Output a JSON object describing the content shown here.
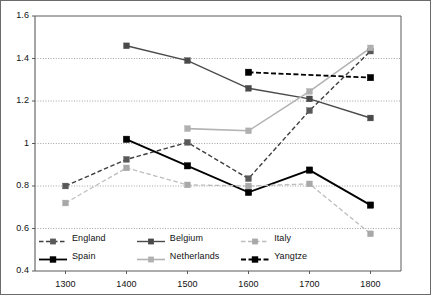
{
  "chart_data": {
    "type": "line",
    "title": "",
    "subtitle": "",
    "xlabel": "",
    "ylabel": "",
    "x": [
      1300,
      1400,
      1500,
      1600,
      1700,
      1800
    ],
    "categories": [
      "1300",
      "1400",
      "1500",
      "1600",
      "1700",
      "1800"
    ],
    "xlim": [
      1250,
      1850
    ],
    "ylim": [
      0.4,
      1.6
    ],
    "yticks": [
      0.4,
      0.6,
      0.8,
      1.0,
      1.2,
      1.4,
      1.6
    ],
    "ytick_labels": [
      "0.4",
      "0.6",
      "0.8",
      "1",
      "1.2",
      "1.4",
      "1.6"
    ],
    "xticks": [
      1300,
      1400,
      1500,
      1600,
      1700,
      1800
    ],
    "xtick_labels": [
      "1300",
      "1400",
      "1500",
      "1600",
      "1700",
      "1800"
    ],
    "grid": "horizontal-dotted",
    "legend_position": "inside-bottom-left",
    "marker": "square",
    "series": [
      {
        "name": "England",
        "color": "#3f3f3f",
        "style": "dashed",
        "width": 1.4,
        "marker_color": "#595959",
        "x": [
          1300,
          1400,
          1500,
          1600,
          1700,
          1800
        ],
        "values": [
          0.8,
          0.925,
          1.005,
          0.835,
          1.155,
          1.435
        ]
      },
      {
        "name": "Spain",
        "color": "#000000",
        "style": "solid",
        "width": 1.8,
        "marker_color": "#000000",
        "x": [
          1400,
          1500,
          1600,
          1700,
          1800
        ],
        "values": [
          1.02,
          0.895,
          0.77,
          0.875,
          0.71
        ]
      },
      {
        "name": "Belgium",
        "color": "#4a4a4a",
        "style": "solid",
        "width": 1.4,
        "marker_color": "#4a4a4a",
        "x": [
          1400,
          1500,
          1600,
          1700,
          1800
        ],
        "values": [
          1.46,
          1.39,
          1.26,
          1.21,
          1.12
        ]
      },
      {
        "name": "Netherlands",
        "color": "#b3b3b3",
        "style": "solid",
        "width": 1.6,
        "marker_color": "#b0b0b0",
        "x": [
          1500,
          1600,
          1700,
          1800
        ],
        "values": [
          1.07,
          1.06,
          1.245,
          1.45
        ]
      },
      {
        "name": "Italy",
        "color": "#bdbdbd",
        "style": "dashed",
        "width": 1.3,
        "marker_color": "#a8a8a8",
        "x": [
          1300,
          1400,
          1500,
          1600,
          1700,
          1800
        ],
        "values": [
          0.72,
          0.885,
          0.805,
          0.8,
          0.81,
          0.575
        ]
      },
      {
        "name": "Yangtze",
        "color": "#000000",
        "style": "dashed",
        "width": 1.8,
        "marker_color": "#000000",
        "x": [
          1600,
          1800
        ],
        "values": [
          1.335,
          1.31
        ]
      }
    ]
  },
  "legend": {
    "rows": [
      [
        {
          "label": "England",
          "series": "England"
        },
        {
          "label": "Belgium",
          "series": "Belgium"
        },
        {
          "label": "Italy",
          "series": "Italy"
        }
      ],
      [
        {
          "label": "Spain",
          "series": "Spain"
        },
        {
          "label": "Netherlands",
          "series": "Netherlands"
        },
        {
          "label": "Yangtze",
          "series": "Yangtze"
        }
      ]
    ]
  },
  "colors": {
    "axis": "#5a5a5a",
    "grid": "#9a9a9a",
    "border": "#6b6b6b",
    "background": "#ffffff",
    "text": "#111111"
  }
}
